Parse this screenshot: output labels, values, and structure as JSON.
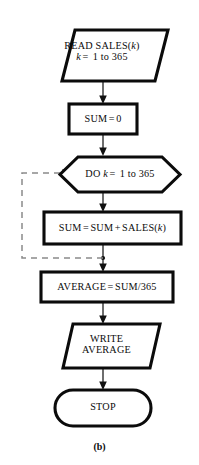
{
  "figure": {
    "caption": "(b)",
    "background_color": "#ffffff",
    "stroke_color": "#0b0b0b",
    "fill_color": "#ffffff",
    "connector_color": "#4a4a4a",
    "dashed_color": "#8a8a8a"
  },
  "nodes": {
    "read": {
      "shape": "parallelogram",
      "line1_prefix": "READ SALES(",
      "line1_var": "k",
      "line1_suffix": ")",
      "line2_var": "k",
      "line2_op": "=",
      "line2_value": "1 to 365"
    },
    "init": {
      "shape": "process",
      "lhs": "SUM",
      "op": "=",
      "rhs": "0"
    },
    "loop": {
      "shape": "hexagon",
      "keyword": "DO",
      "var": "k",
      "op": "=",
      "range": "1 to 365"
    },
    "accumulate": {
      "shape": "process",
      "lhs": "SUM",
      "op1": "=",
      "term1": "SUM",
      "op2": "+",
      "term2_prefix": "SALES(",
      "term2_var": "k",
      "term2_suffix": ")"
    },
    "average": {
      "shape": "process",
      "lhs": "AVERAGE",
      "op": "=",
      "rhs": "SUM/365"
    },
    "write": {
      "shape": "parallelogram",
      "line1": "WRITE",
      "line2": "AVERAGE"
    },
    "stop": {
      "shape": "terminal",
      "label": "STOP"
    }
  },
  "edges": {
    "read_to_init": {
      "type": "solid",
      "arrow": true
    },
    "init_to_loop": {
      "type": "solid",
      "arrow": true
    },
    "loop_to_accumulate": {
      "type": "solid",
      "arrow": true
    },
    "accumulate_to_average": {
      "type": "solid",
      "arrow": true
    },
    "loopback_to_loop": {
      "type": "dashed",
      "arrow": true
    },
    "average_to_write": {
      "type": "solid",
      "arrow": true
    },
    "write_to_stop": {
      "type": "solid",
      "arrow": true
    }
  }
}
